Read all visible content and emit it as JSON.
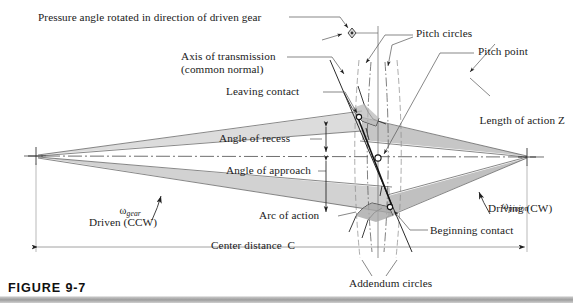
{
  "figure": {
    "caption": "FIGURE 9-7"
  },
  "colors": {
    "line": "#4a4a4a",
    "line_dark": "#1f1f1f",
    "shade_light": "#dddddd",
    "shade_mid": "#cccccc",
    "shade_dark": "#b4b4b4",
    "text": "#1a1a1a",
    "caption_bar": "#9e9e9e"
  },
  "labels": {
    "pressure_angle": "Pressure angle rotated in direction of driven gear",
    "axis_of_transmission_line1": "Axis of transmission",
    "axis_of_transmission_line2": "(common normal)",
    "leaving_contact": "Leaving contact",
    "angle_of_recess": "Angle of recess",
    "angle_of_approach": "Angle of approach",
    "pitch_circles": "Pitch circles",
    "pitch_point": "Pitch point",
    "length_of_action": "Length of action Z",
    "arc_of_action": "Arc of action",
    "beginning_contact": "Beginning contact",
    "addendum_circles": "Addendum circles",
    "center_distance": "Center distance  C",
    "driven": "Driven (CCW)",
    "driving": "Driving (CW)",
    "omega_gear_symbol": "ω",
    "omega_gear_sub": "gear",
    "omega_pinion_symbol": "ω",
    "omega_pinion_sub": "pinion"
  },
  "geometry": {
    "gear_center": {
      "x": 36,
      "y": 156
    },
    "pinion_center": {
      "x": 527,
      "y": 157
    },
    "pitch_point": {
      "x": 378,
      "y": 158
    },
    "begin_contact": {
      "x": 388,
      "y": 208
    },
    "leave_contact": {
      "x": 359,
      "y": 116
    },
    "pressure_angle_marker": {
      "x": 352,
      "y": 33
    },
    "centerline_y": 156,
    "dimension_line_y": 247
  }
}
